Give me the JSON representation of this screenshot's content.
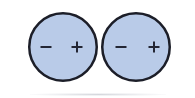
{
  "figure": {
    "canvas": {
      "width": 195,
      "height": 98,
      "background_color": "#FFFFFF"
    },
    "style": {
      "circle_fill_color": "#B9CBE8",
      "circle_stroke_color": "#1C1E28",
      "circle_stroke_width": 2.5,
      "symbol_color": "#232634",
      "symbol_stroke_width": 2
    },
    "circles": [
      {
        "id": "left-circle",
        "label": "Left circle",
        "cx": 63,
        "cy": 47,
        "r": 35,
        "symbols": [
          {
            "id": "left-minus",
            "glyph": "−",
            "name": "minus",
            "cx": 46,
            "cy": 47
          },
          {
            "id": "left-plus",
            "glyph": "+",
            "name": "plus",
            "cx": 77,
            "cy": 47
          }
        ]
      },
      {
        "id": "right-circle",
        "label": "Right circle",
        "cx": 136,
        "cy": 47,
        "r": 35,
        "symbols": [
          {
            "id": "right-minus",
            "glyph": "−",
            "name": "minus",
            "cx": 121,
            "cy": 47
          },
          {
            "id": "right-plus",
            "glyph": "+",
            "name": "plus",
            "cx": 154,
            "cy": 47
          }
        ]
      }
    ],
    "annotations": {
      "tangent_point_x": 99,
      "tangent_point_y": 47,
      "scan_artifact": "faint gray smudge along bottom edge"
    }
  }
}
